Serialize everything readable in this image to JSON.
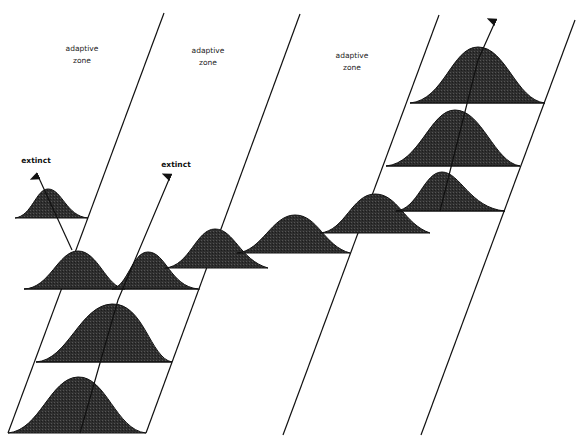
{
  "diagram": {
    "type": "evolutionary-adaptive-zones",
    "zones": [
      {
        "label_line1": "adaptive",
        "label_line2": "zone"
      },
      {
        "label_line1": "adaptive",
        "label_line2": "zone"
      },
      {
        "label_line1": "adaptive",
        "label_line2": "zone"
      }
    ],
    "extinct_labels": [
      "extinct",
      "extinct"
    ],
    "colors": {
      "fill": "#2b2b2b",
      "stroke": "#111111",
      "background": "#ffffff"
    }
  }
}
